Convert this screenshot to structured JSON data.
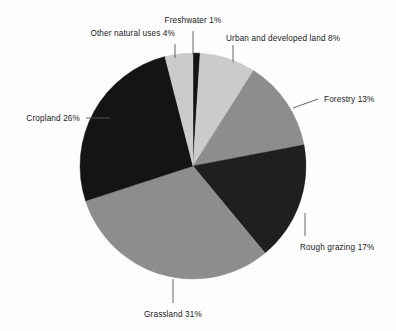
{
  "chart_data": {
    "type": "pie",
    "title": "",
    "subtitle": "",
    "xlabel": "",
    "ylabel": "",
    "legend_position": "none",
    "grid": false,
    "labels_outside": true,
    "units": "percent",
    "total": 100,
    "start_angle_deg": 0,
    "direction": "clockwise",
    "categories": [
      "Freshwater",
      "Urban and developed land",
      "Forestry",
      "Rough grazing",
      "Grassland",
      "Cropland",
      "Other natural uses"
    ],
    "values": [
      1,
      8,
      13,
      17,
      31,
      26,
      4
    ],
    "slices": [
      {
        "name": "Freshwater",
        "value": 1,
        "label": "Freshwater 1%",
        "color": "#141414",
        "start_deg": 0,
        "end_deg": 3.6
      },
      {
        "name": "Urban and developed land",
        "value": 8,
        "label": "Urban and developed land 8%",
        "color": "#cbcbcb",
        "start_deg": 3.6,
        "end_deg": 32.4
      },
      {
        "name": "Forestry",
        "value": 13,
        "label": "Forestry 13%",
        "color": "#8d8d8d",
        "start_deg": 32.4,
        "end_deg": 79.2
      },
      {
        "name": "Rough grazing",
        "value": 17,
        "label": "Rough grazing 17%",
        "color": "#1f1f1f",
        "start_deg": 79.2,
        "end_deg": 140.4
      },
      {
        "name": "Grassland",
        "value": 31,
        "label": "Grassland 31%",
        "color": "#8d8d8d",
        "start_deg": 140.4,
        "end_deg": 252.0
      },
      {
        "name": "Cropland",
        "value": 26,
        "label": "Cropland 26%",
        "color": "#141414",
        "start_deg": 252.0,
        "end_deg": 345.6
      },
      {
        "name": "Other natural uses",
        "value": 4,
        "label": "Other natural uses 4%",
        "color": "#cbcbcb",
        "start_deg": 345.6,
        "end_deg": 360.0
      }
    ],
    "geometry": {
      "center_x": 193,
      "center_y": 166,
      "radius": 113
    },
    "background_color": "#fdfdfd",
    "label_color": "#1a1a1a",
    "leader_color": "#555555"
  }
}
